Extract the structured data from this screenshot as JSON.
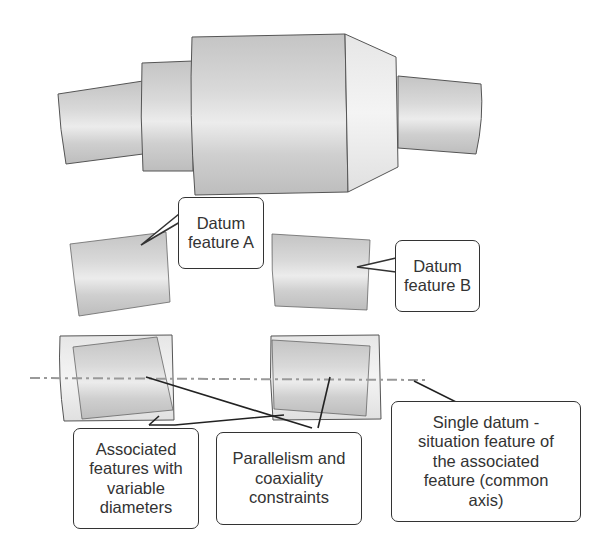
{
  "diagram": {
    "colors": {
      "part_fill": "#cfcfcf",
      "part_highlight": "#ececec",
      "outline": "#555555",
      "callout_border": "#333333",
      "text": "#333333",
      "axis_line": "#999999"
    },
    "part": {
      "label": "Stepped shaft (full part)"
    },
    "datum_features": [
      {
        "id": "A",
        "line1": "Datum",
        "line2": "feature A"
      },
      {
        "id": "B",
        "line1": "Datum",
        "line2": "feature B"
      }
    ],
    "callouts": {
      "associated": {
        "lines": [
          "Associated",
          "features with",
          "variable",
          "diameters"
        ]
      },
      "constraints": {
        "lines": [
          "Parallelism and",
          "coaxiality",
          "constraints"
        ]
      },
      "datum": {
        "lines": [
          "Single datum -",
          "situation feature of",
          "the associated",
          "feature (common",
          "axis)"
        ]
      }
    },
    "axis": {
      "style": "dash-dot",
      "label": "common axis"
    }
  }
}
